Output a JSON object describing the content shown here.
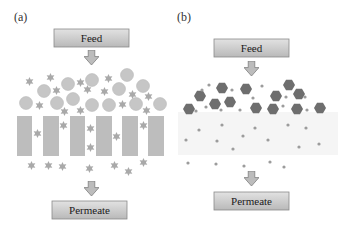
{
  "figure": {
    "type": "membrane separation schematic",
    "colors": {
      "box_fill_top": "#d9d9d9",
      "box_fill_bottom": "#bdbdbd",
      "box_stroke": "#8a8a8a",
      "arrow_fill": "#bcbcbc",
      "arrow_stroke": "#7a7a7a",
      "circle": "#c6c6c6",
      "circle_stroke": "#b0b0b0",
      "star": "#a9a9a9",
      "pillar": "#bdbdbd",
      "hexagon": "#6e6e6e",
      "dot": "#9c9c9c",
      "membrane_band": "#f4f4f4"
    },
    "panels": [
      {
        "id": "a",
        "label": "(a)",
        "feed_label": "Feed",
        "permeate_label": "Permeate",
        "membrane": "porous membrane with pillars; large circles retained, small stars pass through pores"
      },
      {
        "id": "b",
        "label": "(b)",
        "feed_label": "Feed",
        "permeate_label": "Permeate",
        "membrane": "dense membrane; large hexagons retained, small dots diffuse through"
      }
    ]
  }
}
